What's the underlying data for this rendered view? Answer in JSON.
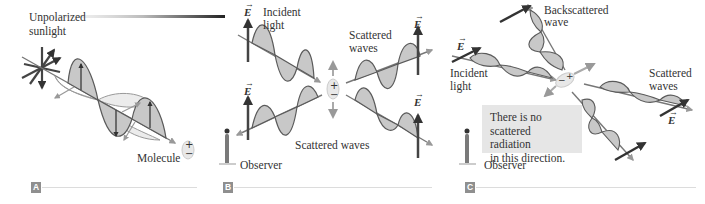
{
  "panels": [
    {
      "id": "A",
      "badge": "A",
      "labels": {
        "source_line1": "Unpolarized",
        "source_line2": "sunlight",
        "molecule": "Molecule"
      }
    },
    {
      "id": "B",
      "badge": "B",
      "labels": {
        "incident_line1": "Incident",
        "incident_line2": "light",
        "scattered_upper_line1": "Scattered",
        "scattered_upper_line2": "waves",
        "scattered_lower": "Scattered waves",
        "observer": "Observer"
      },
      "e_vector": "E"
    },
    {
      "id": "C",
      "badge": "C",
      "labels": {
        "backscattered_line1": "Backscattered",
        "backscattered_line2": "wave",
        "incident_line1": "Incident",
        "incident_line2": "light",
        "scattered_line1": "Scattered",
        "scattered_line2": "waves",
        "observer": "Observer"
      },
      "note": {
        "line1": "There is no",
        "line2": "scattered radiation",
        "line3": "in this direction."
      },
      "e_vector": "E"
    }
  ],
  "molecule": {
    "plus": "+",
    "minus": "−"
  },
  "vector_arrow": "→",
  "colors": {
    "wave_fill": "#c8c8c8",
    "wave_fill_light": "#ececec",
    "wave_stroke": "#5a5a5a",
    "axis": "#7a7a7a",
    "vector_dark": "#444444",
    "badge": "#8f8f8f",
    "note_bg": "#e6e6e6"
  }
}
